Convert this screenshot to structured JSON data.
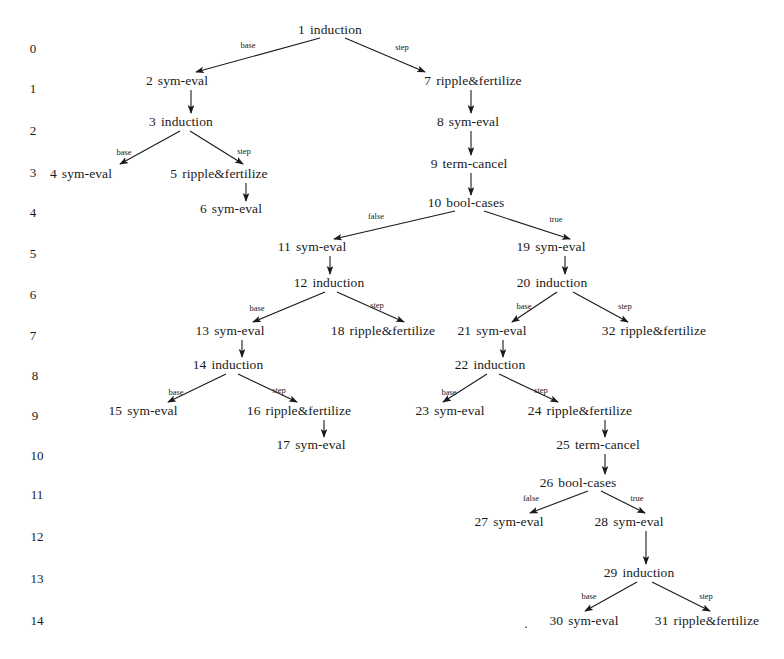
{
  "figure": {
    "kind": "proof-search-tree",
    "background_color": "#ffffff",
    "ink_color": "#1a1a1a",
    "width": 784,
    "height": 659
  },
  "row_labels": [
    {
      "text": "0",
      "x": 33,
      "y": 48
    },
    {
      "text": "1",
      "x": 33,
      "y": 88
    },
    {
      "text": "2",
      "x": 33,
      "y": 130
    },
    {
      "text": "3",
      "x": 33,
      "y": 172
    },
    {
      "text": "4",
      "x": 33,
      "y": 212
    },
    {
      "text": "5",
      "x": 33,
      "y": 253
    },
    {
      "text": "6",
      "x": 33,
      "y": 294
    },
    {
      "text": "7",
      "x": 33,
      "y": 335
    },
    {
      "text": "8",
      "x": 35,
      "y": 375
    },
    {
      "text": "9",
      "x": 35,
      "y": 415
    },
    {
      "text": "10",
      "x": 37,
      "y": 455
    },
    {
      "text": "11",
      "x": 37,
      "y": 494
    },
    {
      "text": "12",
      "x": 37,
      "y": 536
    },
    {
      "text": "13",
      "x": 37,
      "y": 578
    },
    {
      "text": "14",
      "x": 37,
      "y": 620
    }
  ],
  "nodes": [
    {
      "id": "1",
      "label": "induction",
      "x": 330,
      "y": 30,
      "row": 0
    },
    {
      "id": "2",
      "label": "sym-eval",
      "x": 177,
      "y": 81,
      "row": 1
    },
    {
      "id": "7",
      "label": "ripple&fertilize",
      "x": 473,
      "y": 81,
      "row": 1
    },
    {
      "id": "3",
      "label": "induction",
      "x": 181,
      "y": 122,
      "row": 2
    },
    {
      "id": "8",
      "label": "sym-eval",
      "x": 468,
      "y": 122,
      "row": 2
    },
    {
      "id": "4",
      "label": "sym-eval",
      "x": 81,
      "y": 174,
      "row": 3
    },
    {
      "id": "5",
      "label": "ripple&fertilize",
      "x": 219,
      "y": 174,
      "row": 3
    },
    {
      "id": "9",
      "label": "term-cancel",
      "x": 469,
      "y": 164,
      "row": 3
    },
    {
      "id": "6",
      "label": "sym-eval",
      "x": 231,
      "y": 209,
      "row": 4
    },
    {
      "id": "10",
      "label": "bool-cases",
      "x": 466,
      "y": 203,
      "row": 4
    },
    {
      "id": "11",
      "label": "sym-eval",
      "x": 312,
      "y": 247,
      "row": 5
    },
    {
      "id": "19",
      "label": "sym-eval",
      "x": 551,
      "y": 247,
      "row": 5
    },
    {
      "id": "12",
      "label": "induction",
      "x": 329,
      "y": 283,
      "row": 6
    },
    {
      "id": "20",
      "label": "induction",
      "x": 552,
      "y": 283,
      "row": 6
    },
    {
      "id": "13",
      "label": "sym-eval",
      "x": 230,
      "y": 331,
      "row": 7
    },
    {
      "id": "18",
      "label": "ripple&fertilize",
      "x": 383,
      "y": 331,
      "row": 7
    },
    {
      "id": "21",
      "label": "sym-eval",
      "x": 492,
      "y": 331,
      "row": 7
    },
    {
      "id": "32",
      "label": "ripple&fertilize",
      "x": 654,
      "y": 331,
      "row": 7
    },
    {
      "id": "14",
      "label": "induction",
      "x": 228,
      "y": 365,
      "row": 8
    },
    {
      "id": "22",
      "label": "induction",
      "x": 490,
      "y": 365,
      "row": 8
    },
    {
      "id": "15",
      "label": "sym-eval",
      "x": 143,
      "y": 411,
      "row": 9
    },
    {
      "id": "16",
      "label": "ripple&fertilize",
      "x": 299,
      "y": 411,
      "row": 9
    },
    {
      "id": "23",
      "label": "sym-eval",
      "x": 450,
      "y": 411,
      "row": 9
    },
    {
      "id": "24",
      "label": "ripple&fertilize",
      "x": 580,
      "y": 411,
      "row": 9
    },
    {
      "id": "17",
      "label": "sym-eval",
      "x": 311,
      "y": 445,
      "row": 10
    },
    {
      "id": "25",
      "label": "term-cancel",
      "x": 598,
      "y": 445,
      "row": 10
    },
    {
      "id": "26",
      "label": "bool-cases",
      "x": 578,
      "y": 483,
      "row": 11
    },
    {
      "id": "27",
      "label": "sym-eval",
      "x": 509,
      "y": 522,
      "row": 12
    },
    {
      "id": "28",
      "label": "sym-eval",
      "x": 629,
      "y": 522,
      "row": 12
    },
    {
      "id": "29",
      "label": "induction",
      "x": 639,
      "y": 573,
      "row": 13
    },
    {
      "id": "30",
      "label": "sym-eval",
      "x": 584,
      "y": 621,
      "row": 14
    },
    {
      "id": "31",
      "label": "ripple&fertilize",
      "x": 707,
      "y": 621,
      "row": 14
    }
  ],
  "edges": [
    {
      "from": "1",
      "to": "2",
      "label": "base",
      "x1": 320,
      "y1": 38,
      "x2": 196,
      "y2": 72,
      "lx": 248,
      "ly": 45
    },
    {
      "from": "1",
      "to": "7",
      "label": "step",
      "x1": 345,
      "y1": 38,
      "x2": 425,
      "y2": 72,
      "lx": 402,
      "ly": 47
    },
    {
      "from": "2",
      "to": "3",
      "label": "",
      "x1": 191,
      "y1": 90,
      "x2": 191,
      "y2": 113,
      "lx": 0,
      "ly": 0
    },
    {
      "from": "3",
      "to": "4",
      "label": "base",
      "x1": 180,
      "y1": 131,
      "x2": 120,
      "y2": 164,
      "lx": 124,
      "ly": 152
    },
    {
      "from": "3",
      "to": "5",
      "label": "step",
      "x1": 190,
      "y1": 131,
      "x2": 243,
      "y2": 164,
      "lx": 244,
      "ly": 151
    },
    {
      "from": "5",
      "to": "6",
      "label": "",
      "x1": 246,
      "y1": 183,
      "x2": 246,
      "y2": 201,
      "lx": 0,
      "ly": 0
    },
    {
      "from": "7",
      "to": "8",
      "label": "",
      "x1": 471,
      "y1": 90,
      "x2": 471,
      "y2": 113,
      "lx": 0,
      "ly": 0
    },
    {
      "from": "8",
      "to": "9",
      "label": "",
      "x1": 471,
      "y1": 131,
      "x2": 471,
      "y2": 155,
      "lx": 0,
      "ly": 0
    },
    {
      "from": "9",
      "to": "10",
      "label": "",
      "x1": 471,
      "y1": 173,
      "x2": 471,
      "y2": 195,
      "lx": 0,
      "ly": 0
    },
    {
      "from": "10",
      "to": "11",
      "label": "false",
      "x1": 455,
      "y1": 211,
      "x2": 334,
      "y2": 239,
      "lx": 376,
      "ly": 216
    },
    {
      "from": "10",
      "to": "19",
      "label": "true",
      "x1": 484,
      "y1": 211,
      "x2": 570,
      "y2": 239,
      "lx": 556,
      "ly": 219
    },
    {
      "from": "11",
      "to": "12",
      "label": "",
      "x1": 330,
      "y1": 256,
      "x2": 330,
      "y2": 274,
      "lx": 0,
      "ly": 0
    },
    {
      "from": "12",
      "to": "13",
      "label": "base",
      "x1": 325,
      "y1": 292,
      "x2": 253,
      "y2": 322,
      "lx": 257,
      "ly": 308
    },
    {
      "from": "12",
      "to": "18",
      "label": "step",
      "x1": 337,
      "y1": 292,
      "x2": 404,
      "y2": 322,
      "lx": 377,
      "ly": 305
    },
    {
      "from": "13",
      "to": "14",
      "label": "",
      "x1": 242,
      "y1": 340,
      "x2": 242,
      "y2": 357,
      "lx": 0,
      "ly": 0
    },
    {
      "from": "14",
      "to": "15",
      "label": "base",
      "x1": 226,
      "y1": 374,
      "x2": 168,
      "y2": 402,
      "lx": 176,
      "ly": 392
    },
    {
      "from": "14",
      "to": "16",
      "label": "step",
      "x1": 238,
      "y1": 374,
      "x2": 297,
      "y2": 402,
      "lx": 279,
      "ly": 390
    },
    {
      "from": "16",
      "to": "17",
      "label": "",
      "x1": 324,
      "y1": 420,
      "x2": 324,
      "y2": 437,
      "lx": 0,
      "ly": 0
    },
    {
      "from": "19",
      "to": "20",
      "label": "",
      "x1": 565,
      "y1": 256,
      "x2": 565,
      "y2": 274,
      "lx": 0,
      "ly": 0
    },
    {
      "from": "20",
      "to": "21",
      "label": "base",
      "x1": 557,
      "y1": 292,
      "x2": 512,
      "y2": 322,
      "lx": 524,
      "ly": 306
    },
    {
      "from": "20",
      "to": "32",
      "label": "step",
      "x1": 573,
      "y1": 292,
      "x2": 628,
      "y2": 322,
      "lx": 625,
      "ly": 306
    },
    {
      "from": "21",
      "to": "22",
      "label": "",
      "x1": 503,
      "y1": 340,
      "x2": 503,
      "y2": 357,
      "lx": 0,
      "ly": 0
    },
    {
      "from": "22",
      "to": "23",
      "label": "base",
      "x1": 487,
      "y1": 374,
      "x2": 443,
      "y2": 402,
      "lx": 449,
      "ly": 392
    },
    {
      "from": "22",
      "to": "24",
      "label": "step",
      "x1": 499,
      "y1": 374,
      "x2": 558,
      "y2": 402,
      "lx": 541,
      "ly": 390
    },
    {
      "from": "24",
      "to": "25",
      "label": "",
      "x1": 605,
      "y1": 420,
      "x2": 605,
      "y2": 437,
      "lx": 0,
      "ly": 0
    },
    {
      "from": "25",
      "to": "26",
      "label": "",
      "x1": 605,
      "y1": 454,
      "x2": 605,
      "y2": 474,
      "lx": 0,
      "ly": 0
    },
    {
      "from": "26",
      "to": "27",
      "label": "false",
      "x1": 588,
      "y1": 491,
      "x2": 530,
      "y2": 513,
      "lx": 531,
      "ly": 498
    },
    {
      "from": "26",
      "to": "28",
      "label": "true",
      "x1": 601,
      "y1": 491,
      "x2": 645,
      "y2": 513,
      "lx": 637,
      "ly": 498
    },
    {
      "from": "28",
      "to": "29",
      "label": "",
      "x1": 646,
      "y1": 531,
      "x2": 646,
      "y2": 564,
      "lx": 0,
      "ly": 0
    },
    {
      "from": "29",
      "to": "30",
      "label": "base",
      "x1": 637,
      "y1": 582,
      "x2": 585,
      "y2": 611,
      "lx": 589,
      "ly": 596
    },
    {
      "from": "29",
      "to": "31",
      "label": "step",
      "x1": 652,
      "y1": 582,
      "x2": 710,
      "y2": 611,
      "lx": 706,
      "ly": 596
    }
  ],
  "stray_marks": [
    {
      "text": ".",
      "x": 526,
      "y": 624
    }
  ]
}
